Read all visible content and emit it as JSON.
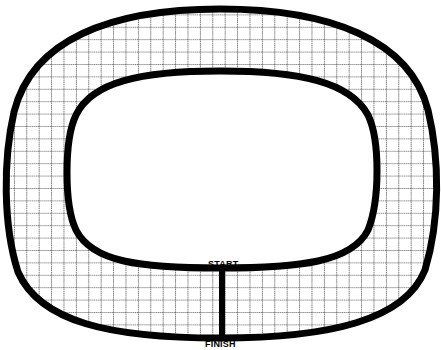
{
  "diagram": {
    "type": "race-track",
    "labels": {
      "start": "START",
      "finish": "FINISH"
    },
    "colors": {
      "track_outline": "#000000",
      "grid_lines": "#555555",
      "background": "#ffffff"
    },
    "grid_spacing_px": 12.4
  }
}
